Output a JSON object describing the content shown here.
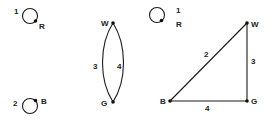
{
  "graphs": [
    {
      "id": "graph-1",
      "loop_label": "1",
      "node_label": "R"
    },
    {
      "id": "graph-2",
      "loop_label": "2",
      "node_label": "B"
    },
    {
      "id": "graph-3",
      "nodes": {
        "top": "W",
        "bottom": "G"
      },
      "edges": {
        "left": "3",
        "right": "4"
      }
    },
    {
      "id": "graph-4",
      "loop_label": "1",
      "loop_node": "R",
      "nodes": {
        "w": "W",
        "g": "G",
        "b": "B"
      },
      "edges": {
        "bw": "2",
        "wg": "3",
        "bg": "4"
      }
    }
  ]
}
